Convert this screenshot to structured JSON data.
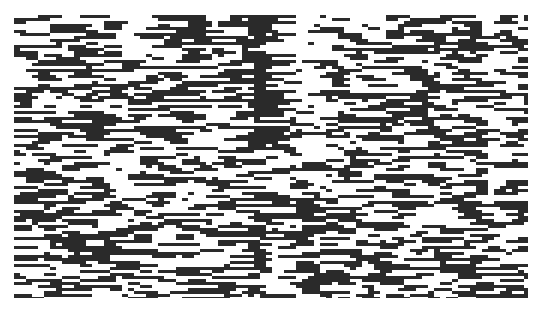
{
  "figure": {
    "type": "binary-raster",
    "background": "#ffffff",
    "foreground": "#2a2a2a",
    "plot_area": {
      "x": 14,
      "y": 15,
      "width": 514,
      "height": 283
    },
    "cell": {
      "width": 6,
      "height": 3
    },
    "density": 0.5,
    "streaks": [
      {
        "x": 255,
        "width": 6,
        "kind": "dark",
        "y_end": 150
      },
      {
        "x": 300,
        "width": 4,
        "kind": "light",
        "y_end": 160
      },
      {
        "x": 312,
        "width": 5,
        "kind": "light",
        "y_end": 150
      },
      {
        "x": 478,
        "width": 6,
        "kind": "dark",
        "y_end": 215
      },
      {
        "x": 488,
        "width": 5,
        "kind": "light",
        "y_end": 215
      },
      {
        "x": 125,
        "width": 8,
        "kind": "light",
        "y_end": 60
      }
    ],
    "seed": 1337
  }
}
